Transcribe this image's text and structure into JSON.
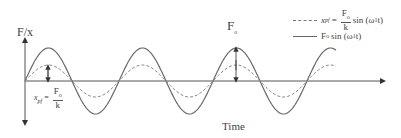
{
  "diagram": {
    "y_axis_label": "F/x",
    "x_axis_label": "Time",
    "peak_label": "F",
    "peak_label_sub": "o",
    "static_annotation": {
      "lhs": "x",
      "lhs_sub": "pf",
      "eq": "=",
      "num": "F",
      "num_sub": "o",
      "den": "k"
    },
    "legend": [
      {
        "style": "dashed",
        "lhs": "x",
        "lhs_sub": "pf",
        "eq": "=",
        "num": "F",
        "num_sub": "o",
        "den": "k",
        "rhs": "sin (ω",
        "rhs_sub": "1",
        "rhs_end": "t)"
      },
      {
        "style": "solid",
        "text": "F",
        "text_sub": "o",
        "rhs": "sin (ω",
        "rhs_sub": "1",
        "rhs_end": "t)"
      }
    ],
    "colors": {
      "solid_curve": "#6a6a6a",
      "dashed_curve": "#8a8a8a",
      "axis": "#555555"
    },
    "curves": {
      "origin_x": 25,
      "axis_y": 81,
      "period_px": 94,
      "end_x": 336,
      "solid_amplitude_px": 33,
      "dashed_amplitude_px": 16
    }
  }
}
